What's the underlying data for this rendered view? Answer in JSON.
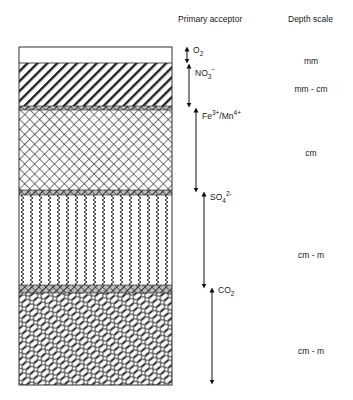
{
  "headers": {
    "acceptor": "Primary acceptor",
    "depth": "Depth scale"
  },
  "layers": [
    {
      "name": "oxic",
      "pattern": "white",
      "top": 47,
      "bottom": 63
    },
    {
      "name": "nitrate-reduction",
      "pattern": "diagonal-hatch",
      "top": 63,
      "bottom": 106
    },
    {
      "name": "transition-1",
      "pattern": "dense-band",
      "top": 106,
      "bottom": 110
    },
    {
      "name": "metal-reduction",
      "pattern": "crosshatch",
      "top": 110,
      "bottom": 190
    },
    {
      "name": "transition-2",
      "pattern": "dense-band",
      "top": 190,
      "bottom": 195
    },
    {
      "name": "sulfate-reduction",
      "pattern": "zigzag",
      "top": 195,
      "bottom": 285
    },
    {
      "name": "transition-3",
      "pattern": "dense-band",
      "top": 285,
      "bottom": 293
    },
    {
      "name": "methanogenesis",
      "pattern": "brick",
      "top": 293,
      "bottom": 385
    }
  ],
  "acceptors": [
    {
      "id": "o2",
      "main": "O",
      "sub": "2",
      "sup": "",
      "rest": "",
      "top": 47,
      "bottom": 63
    },
    {
      "id": "no3",
      "main": "NO",
      "sub": "3",
      "sup": "−",
      "rest": "",
      "top": 63,
      "bottom": 107
    },
    {
      "id": "fe-mn",
      "main": "Fe",
      "sub": "",
      "sup": "3+",
      "rest": "/Mn",
      "sup2": "4+",
      "top": 107,
      "bottom": 191
    },
    {
      "id": "so4",
      "main": "SO",
      "sub": "4",
      "sup": "2-",
      "rest": "",
      "top": 191,
      "bottom": 287
    },
    {
      "id": "co2",
      "main": "CO",
      "sub": "2",
      "sup": "",
      "rest": "",
      "top": 287,
      "bottom": 382
    }
  ],
  "depth_scale": [
    {
      "label": "mm",
      "y": 56
    },
    {
      "label": "mm - cm",
      "y": 84
    },
    {
      "label": "cm",
      "y": 148
    },
    {
      "label": "cm - m",
      "y": 250
    },
    {
      "label": "cm - m",
      "y": 346
    }
  ]
}
